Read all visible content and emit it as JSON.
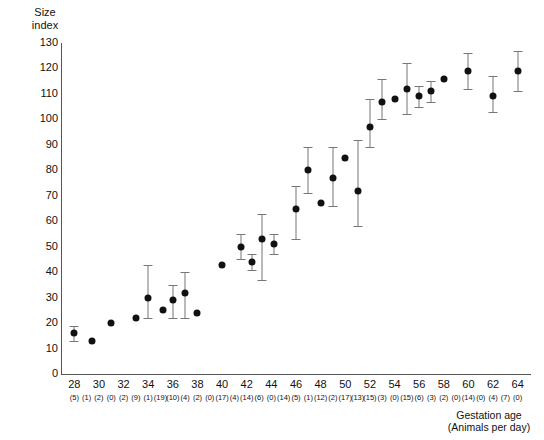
{
  "chart_data": {
    "type": "scatter",
    "title": "",
    "ylabel": "Size index",
    "xlabel": "Gestation age",
    "xlabel_sub": "(Animals per day)",
    "ylim": [
      0,
      130
    ],
    "xlim": [
      27,
      65
    ],
    "yticks": [
      0,
      10,
      20,
      30,
      40,
      50,
      60,
      70,
      80,
      90,
      100,
      110,
      120,
      130
    ],
    "xticks": [
      28,
      30,
      32,
      34,
      36,
      38,
      40,
      42,
      44,
      46,
      48,
      50,
      52,
      54,
      56,
      58,
      60,
      62,
      64
    ],
    "grid": false,
    "legend": "none",
    "counts_label": "Animals per day",
    "counts": [
      {
        "x": 28,
        "n": "(5)"
      },
      {
        "x": 29,
        "n": "(1)"
      },
      {
        "x": 30,
        "n": "(2)"
      },
      {
        "x": 31,
        "n": "(0)"
      },
      {
        "x": 32,
        "n": "(2)"
      },
      {
        "x": 33,
        "n": "(9)"
      },
      {
        "x": 34,
        "n": "(1)"
      },
      {
        "x": 35,
        "n": "(19)"
      },
      {
        "x": 36,
        "n": "(10)"
      },
      {
        "x": 37,
        "n": "(4)"
      },
      {
        "x": 38,
        "n": "(2)"
      },
      {
        "x": 39,
        "n": "(0)"
      },
      {
        "x": 40,
        "n": "(17)"
      },
      {
        "x": 41,
        "n": "(4)"
      },
      {
        "x": 42,
        "n": "(14)"
      },
      {
        "x": 43,
        "n": "(6)"
      },
      {
        "x": 44,
        "n": "(0)"
      },
      {
        "x": 45,
        "n": "(14)"
      },
      {
        "x": 46,
        "n": "(5)"
      },
      {
        "x": 47,
        "n": "(1)"
      },
      {
        "x": 48,
        "n": "(12)"
      },
      {
        "x": 49,
        "n": "(2)"
      },
      {
        "x": 50,
        "n": "(17)"
      },
      {
        "x": 51,
        "n": "(13)"
      },
      {
        "x": 52,
        "n": "(15)"
      },
      {
        "x": 53,
        "n": "(3)"
      },
      {
        "x": 54,
        "n": "(0)"
      },
      {
        "x": 55,
        "n": "(15)"
      },
      {
        "x": 56,
        "n": "(6)"
      },
      {
        "x": 57,
        "n": "(3)"
      },
      {
        "x": 58,
        "n": "(2)"
      },
      {
        "x": 59,
        "n": "(0)"
      },
      {
        "x": 60,
        "n": "(14)"
      },
      {
        "x": 61,
        "n": "(0)"
      },
      {
        "x": 62,
        "n": "(4)"
      },
      {
        "x": 63,
        "n": "(7)"
      },
      {
        "x": 64,
        "n": "(0)"
      }
    ],
    "points": [
      {
        "x": 28,
        "y": 16,
        "lo": 13,
        "hi": 19
      },
      {
        "x": 29.4,
        "y": 13,
        "lo": 13,
        "hi": 13
      },
      {
        "x": 31,
        "y": 20,
        "lo": 20,
        "hi": 20
      },
      {
        "x": 33,
        "y": 22,
        "lo": 22,
        "hi": 22
      },
      {
        "x": 34,
        "y": 30,
        "lo": 22,
        "hi": 43
      },
      {
        "x": 35.2,
        "y": 25,
        "lo": 25,
        "hi": 25
      },
      {
        "x": 36,
        "y": 29,
        "lo": 22,
        "hi": 35
      },
      {
        "x": 37,
        "y": 32,
        "lo": 22,
        "hi": 40
      },
      {
        "x": 38,
        "y": 24,
        "lo": 24,
        "hi": 24
      },
      {
        "x": 40,
        "y": 43,
        "lo": 43,
        "hi": 43
      },
      {
        "x": 41.5,
        "y": 50,
        "lo": 45,
        "hi": 55
      },
      {
        "x": 42.4,
        "y": 44,
        "lo": 41,
        "hi": 47
      },
      {
        "x": 43.2,
        "y": 53,
        "lo": 37,
        "hi": 63
      },
      {
        "x": 44.2,
        "y": 51,
        "lo": 47,
        "hi": 55
      },
      {
        "x": 46,
        "y": 65,
        "lo": 53,
        "hi": 74
      },
      {
        "x": 47,
        "y": 80,
        "lo": 71,
        "hi": 89
      },
      {
        "x": 48,
        "y": 67,
        "lo": 67,
        "hi": 67
      },
      {
        "x": 49,
        "y": 77,
        "lo": 66,
        "hi": 89
      },
      {
        "x": 50,
        "y": 85,
        "lo": 85,
        "hi": 85
      },
      {
        "x": 51,
        "y": 72,
        "lo": 58,
        "hi": 92
      },
      {
        "x": 52,
        "y": 97,
        "lo": 89,
        "hi": 108
      },
      {
        "x": 53,
        "y": 107,
        "lo": 100,
        "hi": 116
      },
      {
        "x": 54,
        "y": 108,
        "lo": 108,
        "hi": 108
      },
      {
        "x": 55,
        "y": 112,
        "lo": 102,
        "hi": 122
      },
      {
        "x": 56,
        "y": 109,
        "lo": 105,
        "hi": 113
      },
      {
        "x": 57,
        "y": 111,
        "lo": 107,
        "hi": 115
      },
      {
        "x": 58,
        "y": 116,
        "lo": 116,
        "hi": 116
      },
      {
        "x": 60,
        "y": 119,
        "lo": 112,
        "hi": 126
      },
      {
        "x": 62,
        "y": 109,
        "lo": 103,
        "hi": 117
      },
      {
        "x": 64,
        "y": 119,
        "lo": 111,
        "hi": 127
      }
    ]
  }
}
